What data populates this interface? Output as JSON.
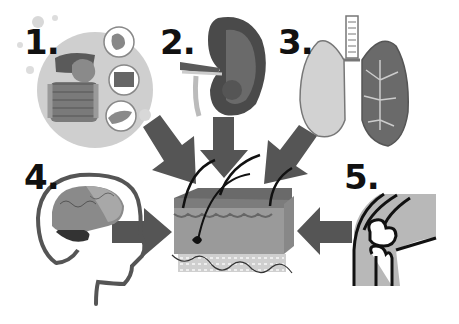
{
  "diagram": {
    "type": "organ-to-skin-influence",
    "center": {
      "label": "skin",
      "icon": "skin-cross-section"
    },
    "arrow_color": "#555555",
    "items": [
      {
        "number": "1.",
        "organ": "digestive system",
        "icon": "digestive-system-icon",
        "arrow_direction": "down-right"
      },
      {
        "number": "2.",
        "organ": "kidney",
        "icon": "kidney-icon",
        "arrow_direction": "down"
      },
      {
        "number": "3.",
        "organ": "lungs",
        "icon": "lungs-icon",
        "arrow_direction": "down-left"
      },
      {
        "number": "4.",
        "organ": "brain",
        "icon": "brain-head-icon",
        "arrow_direction": "right"
      },
      {
        "number": "5.",
        "organ": "knee joint",
        "icon": "knee-joint-icon",
        "arrow_direction": "left"
      }
    ]
  }
}
